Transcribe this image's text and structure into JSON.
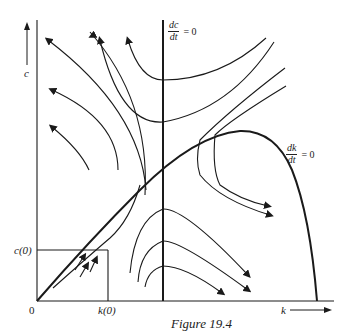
{
  "figure": {
    "caption": "Figure 19.4",
    "axes": {
      "y_label": "c",
      "x_label": "k",
      "origin_label": "0"
    },
    "nullclines": {
      "dc": {
        "num": "dc",
        "den": "dt",
        "eq": "= 0"
      },
      "dk": {
        "num": "dk",
        "den": "dt",
        "eq": "= 0"
      }
    },
    "initial_values": {
      "k0": "k(0)",
      "c0": "c(0)"
    },
    "colors": {
      "line": "#1a1a1a",
      "background": "#ffffff"
    }
  }
}
